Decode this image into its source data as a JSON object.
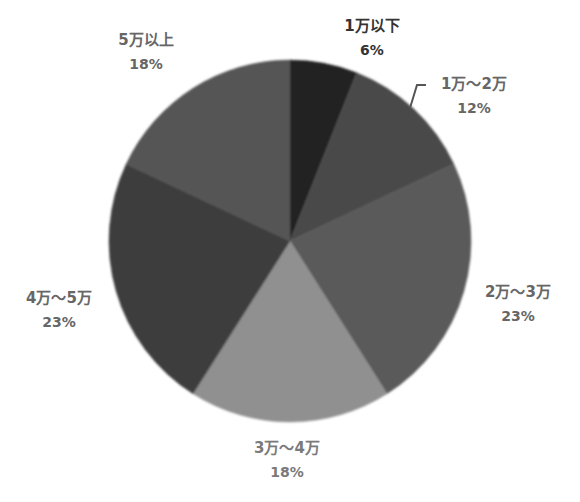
{
  "chart_data": {
    "type": "pie",
    "title": "",
    "start_angle_deg": 0,
    "direction": "clockwise",
    "categories": [
      "1万以下",
      "1万～2万",
      "2万～3万",
      "3万～4万",
      "4万～5万",
      "5万以上"
    ],
    "values": [
      6,
      12,
      23,
      18,
      23,
      18
    ],
    "unit": "%",
    "colors": [
      "#232323",
      "#4a4a4a",
      "#5a5a5a",
      "#909090",
      "#3e3e3e",
      "#555555"
    ],
    "legend": "none (data labels outside slices)",
    "slices": [
      {
        "label": "1万以下",
        "value": 6,
        "pct_text": "6%"
      },
      {
        "label": "1万～2万",
        "value": 12,
        "pct_text": "12%"
      },
      {
        "label": "2万～3万",
        "value": 23,
        "pct_text": "23%"
      },
      {
        "label": "3万～4万",
        "value": 18,
        "pct_text": "18%"
      },
      {
        "label": "4万～5万",
        "value": 23,
        "pct_text": "23%"
      },
      {
        "label": "5万以上",
        "value": 18,
        "pct_text": "18%"
      }
    ]
  },
  "labels": [
    {
      "name": "1万以下",
      "pct": "6%"
    },
    {
      "name": "1万～2万",
      "pct": "12%"
    },
    {
      "name": "2万～3万",
      "pct": "23%"
    },
    {
      "name": "3万～4万",
      "pct": "18%"
    },
    {
      "name": "4万～5万",
      "pct": "23%"
    },
    {
      "name": "5万以上",
      "pct": "18%"
    }
  ]
}
